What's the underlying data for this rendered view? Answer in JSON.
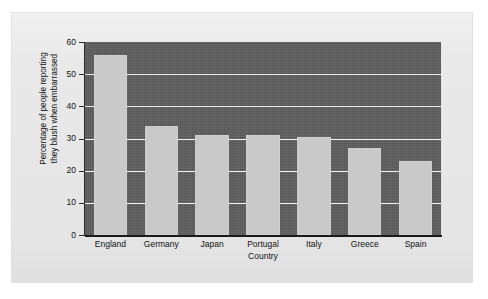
{
  "chart_data": {
    "type": "bar",
    "title": "",
    "subtitle": "",
    "xlabel": "Country",
    "ylabel_line1": "Percentage of people reporting",
    "ylabel_line2": "they blush when embarrassed",
    "ylabel": "Percentage of people reporting they blush when embarrassed",
    "categories": [
      "England",
      "Germany",
      "Japan",
      "Portugal",
      "Italy",
      "Greece",
      "Spain"
    ],
    "values": [
      56,
      34,
      31,
      31,
      30.5,
      27,
      23
    ],
    "ylim": [
      0,
      60
    ],
    "yticks": [
      0,
      10,
      20,
      30,
      40,
      50,
      60
    ],
    "ytick_labels": [
      "0",
      "10",
      "20",
      "30",
      "40",
      "50",
      "60"
    ],
    "gridlines": true,
    "gridline_values": [
      10,
      20,
      30,
      40,
      50
    ],
    "legend": "none",
    "legend_position": "none"
  },
  "colors": {
    "page_background": "#ffffff",
    "sheet_background": "#e9e9e9",
    "plot_background": "#5d5d5d",
    "bar_fill": "#c9c9c9",
    "gridline": "#f0f0f0",
    "axis_line": "#1a1a1a",
    "text": "#111111"
  }
}
